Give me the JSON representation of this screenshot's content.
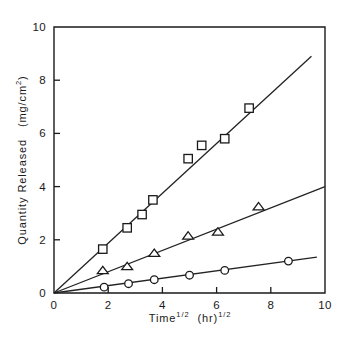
{
  "chart_data": {
    "type": "scatter",
    "title": "",
    "xlabel": "Time^1/2 (hr)^1/2",
    "ylabel": "Quantity Released (mg/cm^2)",
    "xlabel_parts": {
      "base1": "Time",
      "sup1": "1/2",
      "base2": "(hr)",
      "sup2": "1/2"
    },
    "ylabel_parts": {
      "base1": "Quantity Released",
      "base2": "(mg/cm",
      "sup": "2",
      "base3": ")"
    },
    "xlim": [
      0,
      10
    ],
    "ylim": [
      0,
      10
    ],
    "xticks": [
      0,
      2,
      4,
      6,
      8,
      10
    ],
    "yticks": [
      0,
      2,
      4,
      6,
      8,
      10
    ],
    "xtick_labels": [
      "0",
      "2",
      "4",
      "6",
      "8",
      "10"
    ],
    "ytick_labels": [
      "0",
      "2",
      "4",
      "6",
      "8",
      "10"
    ],
    "grid": false,
    "legend": "none",
    "frame": "box",
    "series": [
      {
        "name": "square-series",
        "marker": "square",
        "slope": 0.94,
        "fit_line": [
          [
            0,
            0
          ],
          [
            9.5,
            8.9
          ]
        ],
        "points": [
          [
            1.8,
            1.65
          ],
          [
            2.7,
            2.45
          ],
          [
            3.25,
            2.95
          ],
          [
            3.65,
            3.5
          ],
          [
            4.95,
            5.05
          ],
          [
            5.45,
            5.55
          ],
          [
            6.3,
            5.8
          ],
          [
            7.2,
            6.95
          ]
        ]
      },
      {
        "name": "triangle-series",
        "marker": "triangle",
        "slope": 0.4,
        "fit_line": [
          [
            0,
            0
          ],
          [
            10,
            4.0
          ]
        ],
        "points": [
          [
            1.8,
            0.85
          ],
          [
            2.7,
            1.0
          ],
          [
            3.7,
            1.5
          ],
          [
            4.95,
            2.15
          ],
          [
            6.05,
            2.3
          ],
          [
            7.55,
            3.25
          ]
        ]
      },
      {
        "name": "circle-series",
        "marker": "circle",
        "slope": 0.14,
        "fit_line": [
          [
            0,
            0
          ],
          [
            9.7,
            1.35
          ]
        ],
        "points": [
          [
            1.85,
            0.22
          ],
          [
            2.75,
            0.35
          ],
          [
            3.7,
            0.5
          ],
          [
            5.0,
            0.67
          ],
          [
            6.3,
            0.85
          ],
          [
            8.65,
            1.2
          ]
        ]
      }
    ]
  }
}
